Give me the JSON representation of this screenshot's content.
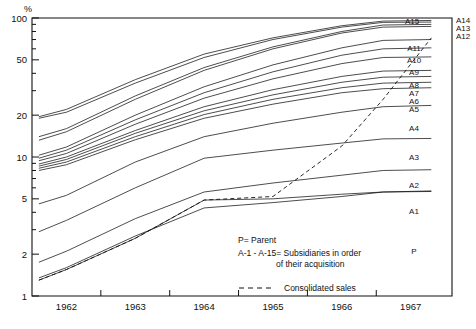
{
  "chart_data": {
    "type": "line",
    "title": "",
    "xlabel": "",
    "ylabel": "%",
    "yscale": "log",
    "ylim": [
      1,
      100
    ],
    "xlim": [
      1961.5,
      1967.6
    ],
    "grid": false,
    "legend_position": "bottom-center",
    "y_ticks": [
      1,
      2,
      5,
      10,
      20,
      50,
      100
    ],
    "y_tick_labels": [
      "1",
      "2",
      "5",
      "10",
      "20",
      "50",
      "100"
    ],
    "x_ticks": [
      1962,
      1963,
      1964,
      1965,
      1966,
      1967
    ],
    "x_tick_labels": [
      "1962",
      "1963",
      "1964",
      "1965",
      "1966",
      "1967"
    ],
    "x": [
      1961.6,
      1962,
      1963,
      1964,
      1965,
      1966,
      1966.6,
      1967.3
    ],
    "series": [
      {
        "name": "A15",
        "label": "A15",
        "values": [
          19.5,
          22.0,
          36.0,
          55.0,
          72.0,
          88.0,
          95.0,
          96.0
        ]
      },
      {
        "name": "A14",
        "label": "A14",
        "values": [
          19.0,
          21.0,
          34.0,
          52.0,
          70.0,
          86.0,
          93.0,
          93.5
        ]
      },
      {
        "name": "A13",
        "label": "A13",
        "values": [
          14.0,
          16.0,
          27.5,
          44.0,
          62.0,
          80.0,
          89.0,
          90.0
        ]
      },
      {
        "name": "A12",
        "label": "A12",
        "values": [
          13.2,
          15.2,
          26.0,
          42.0,
          60.0,
          78.0,
          86.0,
          87.0
        ]
      },
      {
        "name": "A11",
        "label": "A11",
        "values": [
          10.3,
          11.8,
          20.0,
          32.0,
          46.0,
          61.0,
          69.0,
          70.0
        ]
      },
      {
        "name": "A10",
        "label": "A10",
        "values": [
          9.8,
          11.2,
          18.5,
          29.0,
          41.0,
          54.0,
          60.0,
          61.0
        ]
      },
      {
        "name": "A9",
        "label": "A9",
        "values": [
          9.4,
          10.6,
          17.2,
          26.5,
          36.5,
          47.0,
          52.0,
          52.5
        ]
      },
      {
        "name": "A8",
        "label": "A8",
        "values": [
          8.9,
          10.0,
          15.5,
          23.0,
          30.5,
          38.0,
          41.5,
          42.0
        ]
      },
      {
        "name": "A7",
        "label": "A7",
        "values": [
          8.6,
          9.6,
          14.8,
          21.5,
          28.0,
          34.5,
          37.5,
          38.0
        ]
      },
      {
        "name": "A6",
        "label": "A6",
        "values": [
          8.3,
          9.2,
          14.0,
          20.2,
          26.0,
          31.5,
          34.0,
          34.5
        ]
      },
      {
        "name": "A5",
        "label": "A5",
        "values": [
          8.0,
          8.8,
          13.3,
          19.0,
          24.0,
          29.0,
          31.0,
          31.5
        ]
      },
      {
        "name": "A4",
        "label": "A4",
        "values": [
          4.6,
          5.3,
          9.2,
          14.0,
          17.5,
          21.0,
          23.0,
          23.5
        ]
      },
      {
        "name": "A3",
        "label": "A3",
        "values": [
          2.9,
          3.5,
          6.0,
          9.8,
          11.2,
          12.6,
          13.5,
          13.6
        ]
      },
      {
        "name": "A2",
        "label": "A2",
        "values": [
          1.75,
          2.1,
          3.6,
          5.6,
          6.5,
          7.4,
          8.0,
          8.1
        ]
      },
      {
        "name": "A1",
        "label": "A1",
        "values": [
          1.35,
          1.6,
          2.7,
          4.3,
          4.7,
          5.2,
          5.6,
          5.7
        ]
      },
      {
        "name": "P",
        "label": "P",
        "values": [
          1.3,
          1.55,
          2.6,
          4.9,
          5.0,
          5.4,
          5.6,
          5.65
        ]
      }
    ],
    "dashed_series": {
      "name": "consolidated-sales",
      "label": "Consolidated sales",
      "style": "dashed",
      "values": [
        1.3,
        1.55,
        2.6,
        4.9,
        5.2,
        12.0,
        26.0,
        72.0
      ]
    },
    "annotations": {
      "parent_note": "P= Parent",
      "subsidiary_note_line1": "A-1 - A-15= Subsidiaries in order",
      "subsidiary_note_line2": "of their acquisition",
      "legend_dashed_label": "Consolidated sales"
    }
  }
}
